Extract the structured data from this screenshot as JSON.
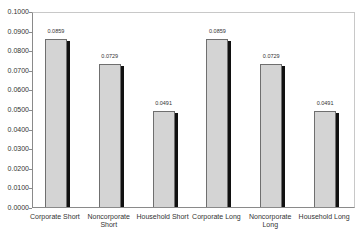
{
  "chart_data": {
    "type": "bar",
    "title": "",
    "xlabel": "",
    "ylabel": "",
    "categories": [
      "Corporate Short",
      "Noncorporate Short",
      "Household Short",
      "Corporate Long",
      "Noncorporate Long",
      "Household Long"
    ],
    "category_lines": [
      [
        "Corporate Short"
      ],
      [
        "Noncorporate",
        "Short"
      ],
      [
        "Household Short"
      ],
      [
        "Corporate Long"
      ],
      [
        "Noncorporate",
        "Long"
      ],
      [
        "Household Long"
      ]
    ],
    "values": [
      0.0859,
      0.0729,
      0.0491,
      0.0859,
      0.0729,
      0.0491
    ],
    "value_labels": [
      "0.0859",
      "0.0729",
      "0.0491",
      "0.0859",
      "0.0729",
      "0.0491"
    ],
    "ylim": [
      0,
      0.1
    ],
    "yticks": [
      "0.0000",
      "0.0100",
      "0.0200",
      "0.0300",
      "0.0400",
      "0.0500",
      "0.0600",
      "0.0700",
      "0.0800",
      "0.0900",
      "0.1000"
    ],
    "grid": false,
    "legend": "none",
    "colors": {
      "bar_fill": "#d4d4d4",
      "bar_border": "#6f6f6f",
      "bar_shadow": "#111111"
    }
  }
}
